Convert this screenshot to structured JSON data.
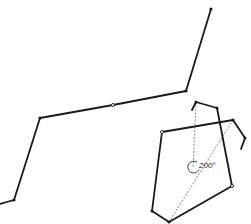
{
  "diagram": {
    "angle_label": "200°",
    "stroke_color": "#1a1a1a",
    "background": "#ffffff",
    "main_polyline": {
      "points": [
        [
          0,
          204
        ],
        [
          14,
          200
        ],
        [
          40,
          118
        ],
        [
          113,
          105
        ],
        [
          186,
          91
        ],
        [
          211,
          9
        ]
      ],
      "filled_joints": [
        [
          14,
          200
        ],
        [
          40,
          118
        ],
        [
          186,
          91
        ],
        [
          211,
          9
        ]
      ],
      "open_joints": [
        [
          113,
          105
        ]
      ]
    },
    "polygon": {
      "outline": [
        [
          162,
          132
        ],
        [
          233,
          120
        ]
      ],
      "lower_outline": [
        [
          217,
          108
        ],
        [
          232,
          186
        ],
        [
          169,
          222
        ],
        [
          152,
          211
        ],
        [
          162,
          132
        ]
      ],
      "top_hook": [
        [
          192,
          109
        ],
        [
          196,
          102
        ],
        [
          217,
          108
        ]
      ],
      "right_hook": [
        [
          233,
          120
        ],
        [
          245,
          138
        ],
        [
          241,
          149
        ]
      ],
      "filled_joints": [
        [
          196,
          102
        ],
        [
          217,
          108
        ],
        [
          233,
          120
        ],
        [
          245,
          138
        ],
        [
          152,
          211
        ],
        [
          169,
          222
        ]
      ],
      "open_joints": [
        [
          162,
          132
        ],
        [
          232,
          186
        ]
      ],
      "dashed_lines": [
        [
          [
            196,
            102
          ],
          [
            193,
            168
          ]
        ],
        [
          [
            233,
            120
          ],
          [
            169,
            222
          ]
        ]
      ],
      "angle_center": [
        195,
        167
      ]
    }
  }
}
